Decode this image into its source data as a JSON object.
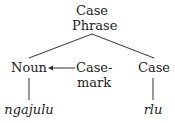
{
  "diagram": {
    "type": "syntax-tree",
    "root": {
      "line1": "Case",
      "line2": "Phrase"
    },
    "nodes": {
      "noun": "Noun",
      "casemark_line1": "Case-",
      "casemark_line2": "mark",
      "case": "Case"
    },
    "leaves": {
      "noun_word": "ngajulu",
      "case_word": "rlu"
    },
    "edges": [
      {
        "from": "Case Phrase",
        "to": "Noun",
        "style": "line"
      },
      {
        "from": "Case Phrase",
        "to": "Case",
        "style": "line"
      },
      {
        "from": "Case-mark",
        "to": "Noun",
        "style": "arrow"
      },
      {
        "from": "Noun",
        "to": "ngajulu",
        "style": "line"
      },
      {
        "from": "Case",
        "to": "rlu",
        "style": "line"
      }
    ],
    "colors": {
      "text": "#222222",
      "line": "#333333",
      "background": "#ffffff"
    }
  }
}
